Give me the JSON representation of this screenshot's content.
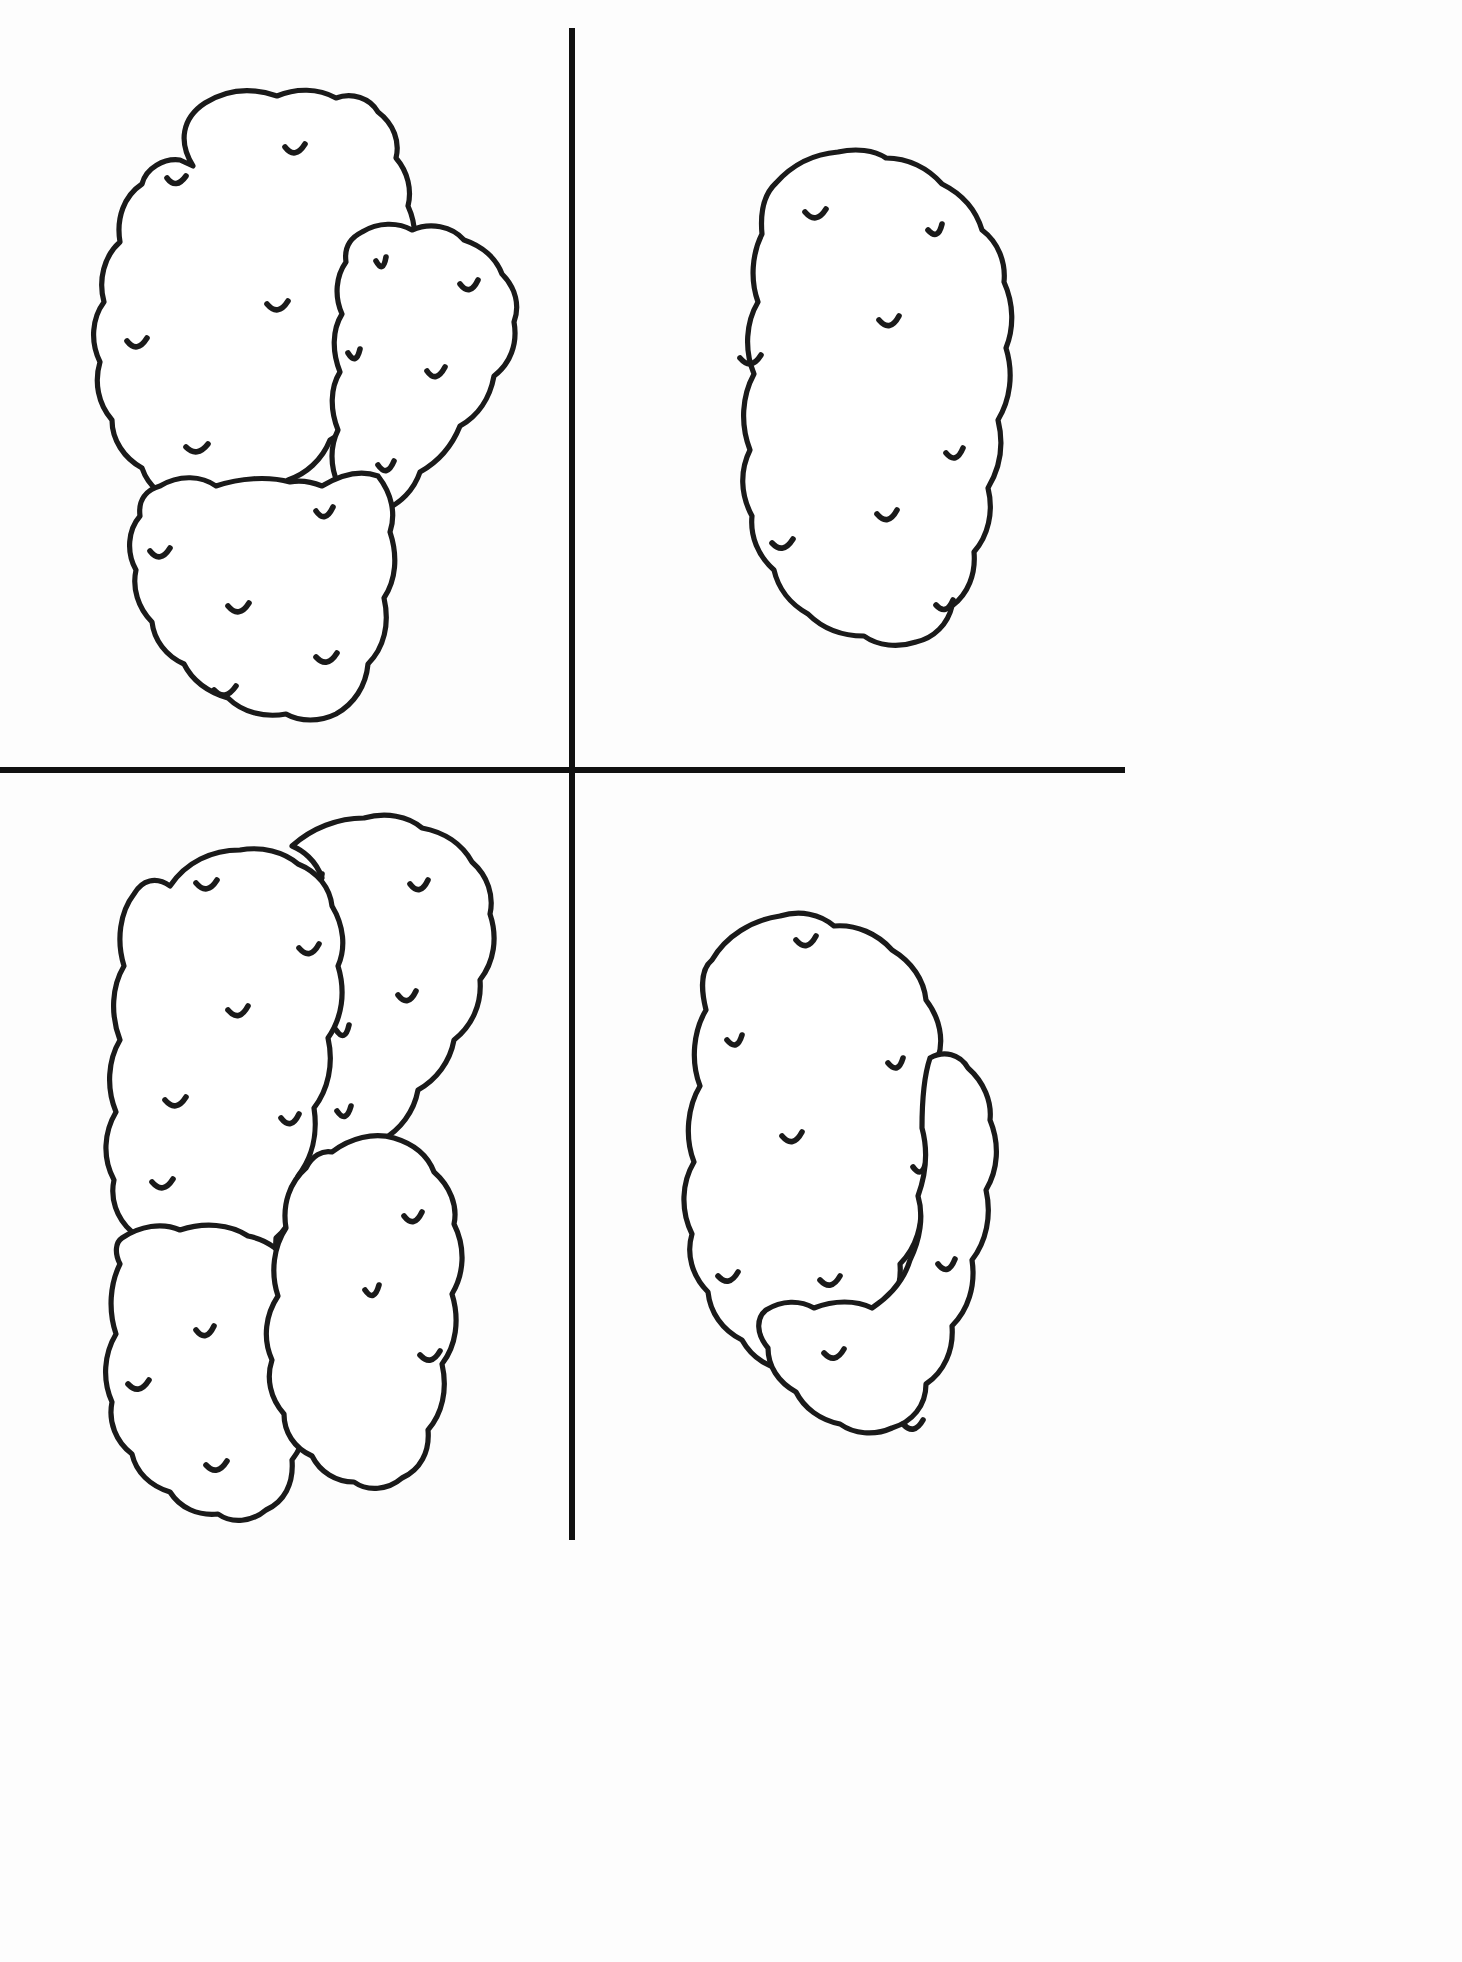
{
  "page": {
    "background_color": "#fdfdfd",
    "ink_color": "#1a1a1a",
    "divider_color": "#111111",
    "width": 1462,
    "height": 1962
  },
  "dividers": {
    "vertical": {
      "x": 572,
      "y1": 28,
      "y2": 1540,
      "thickness": 6
    },
    "horizontal": {
      "y": 770,
      "x1": 0,
      "x2": 1125,
      "thickness": 6
    }
  },
  "quadrants": [
    {
      "id": "top-left",
      "name": "quadrant-top-left",
      "potato_count": 3,
      "arrangement": "cluster of three overlapping tubers",
      "label": ""
    },
    {
      "id": "top-right",
      "name": "quadrant-top-right",
      "potato_count": 1,
      "arrangement": "single large elongated tuber",
      "label": ""
    },
    {
      "id": "bottom-left",
      "name": "quadrant-bottom-left",
      "potato_count": 4,
      "arrangement": "cluster of four overlapping tubers",
      "label": ""
    },
    {
      "id": "bottom-right",
      "name": "quadrant-bottom-right",
      "potato_count": 2,
      "arrangement": "two overlapping tubers",
      "label": ""
    }
  ],
  "chart_data": {
    "type": "table",
    "categories": [
      "Top left",
      "Top right",
      "Bottom left",
      "Bottom right"
    ],
    "values": [
      3,
      1,
      4,
      2
    ],
    "xlabel": "Quadrant",
    "ylabel": "Number of tubers drawn"
  },
  "shapes": {
    "q1_potato_a": {
      "name": "potato-outline-top-left-upper",
      "path": "M 282 122 C 320 94 370 84 400 92 C 430 100 448 112 466 126 C 492 120 520 132 540 156 C 560 180 568 210 560 240 C 570 268 566 300 552 330 C 556 366 548 402 526 432 C 520 462 506 486 482 500 C 452 512 416 516 388 508 C 356 512 330 504 314 484 C 292 462 282 434 284 404 C 272 376 270 344 278 312 C 270 280 272 246 284 216 C 272 186 272 150 282 122 Z",
      "transform": "translate(-140,-10) scale(1.0)"
    }
  },
  "eye_glyph": {
    "name": "potato-eye-tick",
    "description": "short concave-up curved stroke representing a potato eye"
  }
}
